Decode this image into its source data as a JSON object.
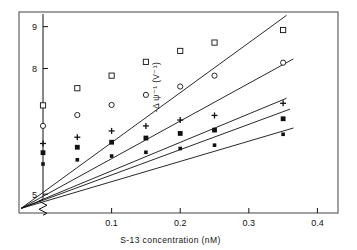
{
  "figure": {
    "frame": {
      "x": 19,
      "y": 12,
      "w": 319,
      "h": 201
    },
    "axis_break_symbol": "zigzag"
  },
  "chart_data": {
    "type": "scatter",
    "title": "",
    "subtitle": "",
    "xlabel": "S-13 concentration  (nM)",
    "ylabel": "-Δ ψ⁻¹ (V⁻¹)",
    "xlim": [
      -0.035,
      0.43
    ],
    "ylim": [
      4.55,
      9.35
    ],
    "x_ticks": [
      0.1,
      0.2,
      0.3,
      0.4
    ],
    "x_tick_labels": [
      "0.1",
      "0.2",
      "0.3",
      "0.4"
    ],
    "y_ticks": [
      5,
      8,
      9
    ],
    "y_tick_labels": [
      "5",
      "8",
      "9"
    ],
    "grid": false,
    "legend": "none",
    "y_axis_break": true,
    "y_axis_at_x": 0.0,
    "convergence_point": {
      "x": -0.032,
      "y": 4.66
    },
    "series": [
      {
        "name": "series-1-open-square",
        "marker": "open-square",
        "x": [
          0.0,
          0.05,
          0.1,
          0.15,
          0.2,
          0.25,
          0.35
        ],
        "y": [
          7.12,
          7.53,
          7.83,
          8.16,
          8.42,
          8.62,
          8.92
        ],
        "fit_x": [
          -0.032,
          0.355
        ],
        "fit_y": [
          4.66,
          9.27
        ]
      },
      {
        "name": "series-2-open-circle",
        "marker": "open-circle",
        "x": [
          0.0,
          0.05,
          0.1,
          0.15,
          0.2,
          0.25,
          0.35
        ],
        "y": [
          6.63,
          6.89,
          7.13,
          7.37,
          7.57,
          7.83,
          8.14
        ],
        "fit_x": [
          -0.032,
          0.365
        ],
        "fit_y": [
          4.66,
          8.23
        ]
      },
      {
        "name": "series-3-plus",
        "marker": "plus",
        "x": [
          0.0,
          0.05,
          0.1,
          0.15,
          0.2,
          0.25,
          0.35
        ],
        "y": [
          6.21,
          6.36,
          6.51,
          6.63,
          6.77,
          6.88,
          7.17
        ],
        "fit_x": [
          -0.032,
          0.355
        ],
        "fit_y": [
          4.66,
          7.29
        ]
      },
      {
        "name": "series-4-filled-square",
        "marker": "filled-square",
        "x": [
          0.0,
          0.05,
          0.1,
          0.15,
          0.2,
          0.25,
          0.35
        ],
        "y": [
          5.99,
          6.12,
          6.24,
          6.34,
          6.45,
          6.53,
          6.8
        ],
        "fit_x": [
          -0.032,
          0.36
        ],
        "fit_y": [
          4.66,
          7.03
        ]
      },
      {
        "name": "series-5-small-filled",
        "marker": "small-filled-square",
        "x": [
          0.0,
          0.05,
          0.1,
          0.15,
          0.2,
          0.25,
          0.35
        ],
        "y": [
          5.72,
          5.82,
          5.91,
          6.0,
          6.09,
          6.17,
          6.43
        ],
        "fit_x": [
          -0.032,
          0.365
        ],
        "fit_y": [
          4.66,
          6.58
        ]
      }
    ]
  }
}
